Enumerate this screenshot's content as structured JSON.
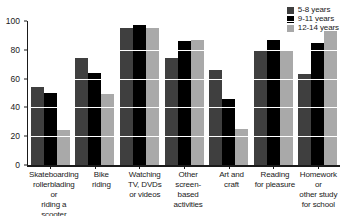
{
  "chart_data": {
    "type": "bar",
    "title": "",
    "xlabel": "",
    "ylabel": "",
    "ylim": [
      0,
      100
    ],
    "yticks": [
      0,
      20,
      40,
      60,
      80,
      100
    ],
    "ytick_labels": [
      "0",
      "20",
      "40",
      "60",
      "80",
      "100"
    ],
    "grid": "horizontal-white-over-bars",
    "legend_position": "top-right",
    "categories": [
      "Skateboarding rollerblading or riding a scooter",
      "Bike riding",
      "Watching TV, DVDs or videos",
      "Other screen-based activities",
      "Art and craft",
      "Reading for pleasure",
      "Homework or other study for school"
    ],
    "category_lines": [
      [
        "Skateboarding",
        "rollerblading or",
        "riding a scooter"
      ],
      [
        "Bike",
        "riding"
      ],
      [
        "Watching",
        "TV, DVDs",
        "or videos"
      ],
      [
        "Other",
        "screen-based",
        "activities"
      ],
      [
        "Art and",
        "craft"
      ],
      [
        "Reading",
        "for pleasure"
      ],
      [
        "Homework or",
        "other study",
        "for school"
      ]
    ],
    "series": [
      {
        "name": "5-8 years",
        "color": "#3f3f3f",
        "values": [
          54,
          74,
          95,
          74,
          66,
          79,
          63
        ]
      },
      {
        "name": "9-11 years",
        "color": "#000000",
        "values": [
          50,
          64,
          97,
          86,
          46,
          87,
          85
        ]
      },
      {
        "name": "12-14 years",
        "color": "#a9a9a9",
        "values": [
          24,
          49,
          95,
          87,
          25,
          79,
          93
        ]
      }
    ]
  },
  "legend": {
    "items": [
      {
        "label": "5-8 years",
        "color": "#3f3f3f"
      },
      {
        "label": "9-11 years",
        "color": "#000000"
      },
      {
        "label": "12-14 years",
        "color": "#a9a9a9"
      }
    ]
  }
}
